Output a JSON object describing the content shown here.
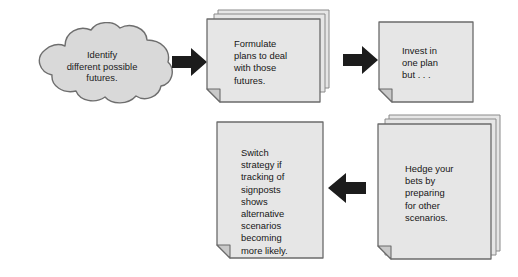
{
  "diagram": {
    "colors": {
      "node_fill": "#d9d9d9",
      "doc_fill": "#e6e6e6",
      "fold_fill": "#c9c9c9",
      "stroke": "#6b6b6b",
      "arrow_fill": "#1c1c1c",
      "text": "#161616",
      "background": "#ffffff"
    },
    "nodes": [
      {
        "id": "identify-futures",
        "shape": "cloud",
        "text": "Identify\ndifferent possible\nfutures.",
        "align": "center"
      },
      {
        "id": "formulate-plans",
        "shape": "document-stack",
        "pages": 3,
        "text": "Formulate\nplans to deal\nwith those\nfutures."
      },
      {
        "id": "invest-one-plan",
        "shape": "document",
        "pages": 1,
        "text": "Invest in\none plan\nbut . . ."
      },
      {
        "id": "hedge-bets",
        "shape": "document-stack",
        "pages": 3,
        "text": "Hedge your\nbets by\npreparing\nfor other\nscenarios."
      },
      {
        "id": "switch-strategy",
        "shape": "document",
        "pages": 1,
        "text": "Switch\nstrategy if\ntracking of\nsignposts\nshows\nalternative\nscenarios\nbecoming\nmore likely."
      }
    ],
    "arrows": [
      {
        "id": "cloud-to-formulate",
        "from": "identify-futures",
        "to": "formulate-plans",
        "direction": "right"
      },
      {
        "id": "formulate-to-invest",
        "from": "formulate-plans",
        "to": "invest-one-plan",
        "direction": "right"
      },
      {
        "id": "hedge-to-switch",
        "from": "hedge-bets",
        "to": "switch-strategy",
        "direction": "left"
      }
    ]
  }
}
